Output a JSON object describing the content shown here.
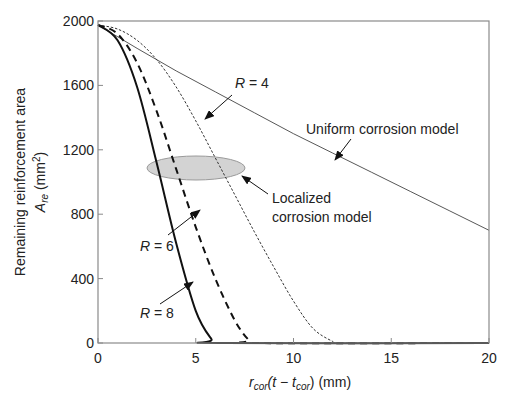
{
  "chart_data": {
    "type": "line",
    "title": "",
    "xlabel": "r_cor(t − t_cor) (mm)",
    "xlabel_parts": {
      "r": "r",
      "cor": "cor",
      "mid": "(t − t",
      "cor2": "cor",
      "end": ") (mm)"
    },
    "ylabel_line1": "Remaining reinforcement area",
    "ylabel_line2_main": "A",
    "ylabel_line2_sub": "re",
    "ylabel_line2_unit": " (mm",
    "ylabel_line2_sup": "2",
    "ylabel_line2_close": ")",
    "xlim": [
      0,
      20
    ],
    "ylim": [
      0,
      2000
    ],
    "xticks": [
      0,
      5,
      10,
      15,
      20
    ],
    "yticks": [
      0,
      400,
      800,
      1200,
      1600,
      2000
    ],
    "grid": false,
    "series": [
      {
        "name": "Uniform corrosion model",
        "style": "thin-solid",
        "x": [
          0,
          2,
          4,
          6,
          8,
          10,
          12,
          14,
          16,
          18,
          20
        ],
        "y": [
          1975,
          1830,
          1690,
          1560,
          1430,
          1300,
          1180,
          1060,
          940,
          820,
          700
        ]
      },
      {
        "name": "R = 4",
        "style": "thin-dotted",
        "x": [
          0,
          1,
          2,
          3,
          4,
          5,
          6,
          7,
          8,
          9,
          10,
          11,
          12,
          12.4,
          20
        ],
        "y": [
          1975,
          1950,
          1880,
          1760,
          1590,
          1380,
          1150,
          920,
          690,
          470,
          260,
          90,
          10,
          0,
          0
        ]
      },
      {
        "name": "R = 6",
        "style": "thick-dashed",
        "x": [
          0,
          1,
          2,
          3,
          4,
          5,
          6,
          7,
          7.7,
          8.1,
          20
        ],
        "y": [
          1975,
          1920,
          1740,
          1440,
          1080,
          720,
          400,
          140,
          20,
          0,
          0
        ]
      },
      {
        "name": "R = 8",
        "style": "thick-solid",
        "x": [
          0,
          1,
          2,
          3,
          4,
          5,
          5.8,
          6.2,
          20
        ],
        "y": [
          1975,
          1880,
          1590,
          1120,
          620,
          200,
          25,
          0,
          0
        ]
      }
    ],
    "annotations": [
      {
        "text": "R = 4",
        "r": "R",
        "eq": " = 4"
      },
      {
        "text": "R = 6",
        "r": "R",
        "eq": " = 6"
      },
      {
        "text": "R = 8",
        "r": "R",
        "eq": " = 8"
      },
      {
        "text": "Uniform corrosion model"
      },
      {
        "text": "Localized corrosion model",
        "line1": "Localized",
        "line2": "corrosion model"
      }
    ],
    "highlight_ellipse": {
      "center_x": 4.3,
      "center_y": 1085,
      "fill": "#d3d3d3"
    }
  },
  "colors": {
    "axis": "#8a8a8a",
    "curve": "#111111",
    "thin": "#444444",
    "ellipse": "#d3d3d3"
  }
}
